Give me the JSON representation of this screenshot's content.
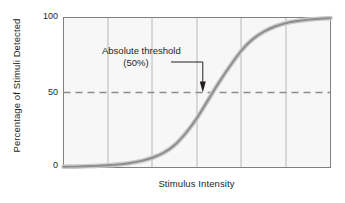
{
  "figure": {
    "background_color": "#ffffff",
    "plot_background_color": "#f7f7f7",
    "grid_color": "#b8b8b8",
    "axis_color": "#808080",
    "curve_color": "#8c8c8c",
    "curve_halo_color": "#c9c9c9",
    "threshold_line_color": "#8c8c8c",
    "text_color": "#231f20"
  },
  "chart_data": {
    "type": "line",
    "title": "",
    "subtitle": "",
    "xlabel": "Stimulus Intensity",
    "ylabel": "Percentage of Stimuli Detected",
    "xlim": [
      0,
      6
    ],
    "ylim": [
      0,
      100
    ],
    "grid": true,
    "x_tick_labels": [],
    "y_tick_labels": [
      "0",
      "50",
      "100"
    ],
    "y_tick_values": [
      0,
      50,
      100
    ],
    "legend": null,
    "legend_position": "none",
    "series": [
      {
        "name": "Psychometric function",
        "x": [
          0.0,
          0.25,
          0.5,
          0.75,
          1.0,
          1.25,
          1.5,
          1.75,
          2.0,
          2.25,
          2.5,
          2.75,
          3.0,
          3.25,
          3.5,
          3.75,
          4.0,
          4.25,
          4.5,
          4.75,
          5.0,
          5.25,
          5.5,
          5.75,
          6.0
        ],
        "values": [
          0.5,
          0.6,
          0.8,
          1.1,
          1.5,
          2.1,
          3.0,
          4.4,
          6.5,
          9.8,
          15.0,
          23.0,
          33.0,
          45.0,
          57.0,
          68.0,
          78.0,
          85.5,
          90.5,
          94.0,
          96.3,
          97.7,
          98.6,
          99.2,
          99.6
        ]
      }
    ],
    "reference_lines": [
      {
        "name": "absolute-threshold-line",
        "axis": "y",
        "value": 50,
        "style": "dashed",
        "label": "50%"
      }
    ],
    "annotations": [
      {
        "name": "absolute-threshold-annotation",
        "line1": "Absolute threshold",
        "line2": "(50%)",
        "points_to_x": 3.13,
        "points_to_y": 50
      }
    ],
    "vertical_gridlines_count": 5
  },
  "annotation": {
    "line1": "Absolute threshold",
    "line2": "(50%)"
  },
  "axes": {
    "y_ticks": {
      "top": "100",
      "middle": "50",
      "bottom": "0"
    },
    "ylabel": "Percentage of Stimuli Detected",
    "xlabel": "Stimulus Intensity"
  }
}
